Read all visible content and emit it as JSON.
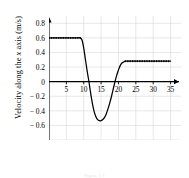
{
  "figure": {
    "caption": "Figure 1-1"
  },
  "chart_data": {
    "type": "line",
    "title": "",
    "xlabel": "",
    "ylabel": "Velocity along the x axis (m/s)",
    "ylabel_parts": {
      "before": "Velocity along the ",
      "italic": "x",
      "after": " axis (m/s)"
    },
    "xlim": [
      0,
      38
    ],
    "ylim": [
      -0.8,
      0.9
    ],
    "xticks": [
      5,
      10,
      15,
      20,
      25,
      30,
      35
    ],
    "yticks": [
      0.8,
      0.6,
      0.4,
      0.2,
      0,
      -0.2,
      -0.4,
      -0.6
    ],
    "ytick_labels": [
      "0.8",
      "0.6",
      "0.4",
      "0.2",
      "0",
      "− 0.2",
      "− 0.4",
      "− 0.6"
    ],
    "xtick_labels": [
      "5",
      "10",
      "15",
      "20",
      "25",
      "30",
      "35"
    ],
    "grid": true,
    "grid_color": "#d9d9d9",
    "grid_x_step": 5,
    "grid_y_step": 0.2,
    "axis_color": "#000000",
    "line_color": "#000000",
    "legend": null,
    "marker_style": "dotted-square",
    "annotations": {
      "plateau_initial_value": 0.6,
      "plateau_initial_range": [
        0,
        9
      ],
      "minimum_value": -0.53,
      "minimum_at_x": 15,
      "plateau_final_value": 0.28,
      "plateau_final_range": [
        22,
        35
      ],
      "zero_crossing_descending": 11.5,
      "zero_crossing_ascending": 19
    },
    "x": [
      0,
      1,
      2,
      3,
      4,
      5,
      6,
      7,
      8,
      9,
      9.5,
      10,
      10.5,
      11,
      11.5,
      12,
      12.5,
      13,
      13.5,
      14,
      14.5,
      15,
      15.5,
      16,
      16.5,
      17,
      17.5,
      18,
      18.5,
      19,
      19.5,
      20,
      20.5,
      21,
      21.5,
      22,
      23,
      24,
      25,
      26,
      27,
      28,
      29,
      30,
      31,
      32,
      33,
      34,
      35
    ],
    "y": [
      0.6,
      0.6,
      0.6,
      0.6,
      0.6,
      0.6,
      0.6,
      0.6,
      0.6,
      0.6,
      0.57,
      0.46,
      0.3,
      0.14,
      0.0,
      -0.16,
      -0.3,
      -0.41,
      -0.48,
      -0.52,
      -0.535,
      -0.535,
      -0.52,
      -0.49,
      -0.44,
      -0.37,
      -0.29,
      -0.2,
      -0.1,
      0.0,
      0.09,
      0.16,
      0.22,
      0.255,
      0.27,
      0.28,
      0.28,
      0.28,
      0.28,
      0.28,
      0.28,
      0.28,
      0.28,
      0.28,
      0.28,
      0.28,
      0.28,
      0.28,
      0.28
    ]
  }
}
